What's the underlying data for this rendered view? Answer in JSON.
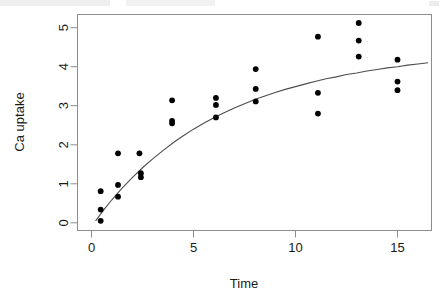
{
  "figure": {
    "title": "",
    "background_color": "#ffffff",
    "point_color": "#000000",
    "curve_color": "#4d4d4d",
    "axis_color": "#8d8d8d"
  },
  "axes": {
    "xlabel": "Time",
    "ylabel": "Ca uptake",
    "x_ticks": [
      "0",
      "5",
      "10",
      "15"
    ],
    "y_ticks": [
      "0",
      "1",
      "2",
      "3",
      "4",
      "5"
    ]
  },
  "chart_data": {
    "type": "scatter",
    "title": "",
    "xlabel": "Time",
    "ylabel": "Ca uptake",
    "xlim": [
      -0.25,
      16.7
    ],
    "ylim": [
      -0.18,
      5.5
    ],
    "x_ticks": [
      0,
      5,
      10,
      15
    ],
    "y_ticks": [
      0,
      1,
      2,
      3,
      4,
      5
    ],
    "grid": false,
    "legend": null,
    "series": [
      {
        "name": "observations",
        "type": "scatter",
        "marker": "filled-circle",
        "color": "#000000",
        "points": [
          [
            0.45,
            0.81
          ],
          [
            0.45,
            0.34
          ],
          [
            0.45,
            0.05
          ],
          [
            1.3,
            1.78
          ],
          [
            1.3,
            0.97
          ],
          [
            1.3,
            0.67
          ],
          [
            2.35,
            1.78
          ],
          [
            2.42,
            1.27
          ],
          [
            2.42,
            1.17
          ],
          [
            3.95,
            3.14
          ],
          [
            3.95,
            2.61
          ],
          [
            3.95,
            2.55
          ],
          [
            6.1,
            3.2
          ],
          [
            6.1,
            3.02
          ],
          [
            6.1,
            2.7
          ],
          [
            8.05,
            3.94
          ],
          [
            8.05,
            3.43
          ],
          [
            8.05,
            3.11
          ],
          [
            11.1,
            4.77
          ],
          [
            11.1,
            3.33
          ],
          [
            11.1,
            2.8
          ],
          [
            13.1,
            5.12
          ],
          [
            13.1,
            4.67
          ],
          [
            13.1,
            4.26
          ],
          [
            15.0,
            4.18
          ],
          [
            15.0,
            3.62
          ],
          [
            15.0,
            3.4
          ]
        ]
      },
      {
        "name": "fitted-curve",
        "type": "line",
        "color": "#4d4d4d",
        "model": "asymptotic-regression",
        "x": [
          0.2,
          0.6,
          1.0,
          1.5,
          2.0,
          2.5,
          3.0,
          3.5,
          4.0,
          4.5,
          5.0,
          5.5,
          6.0,
          6.5,
          7.0,
          7.5,
          8.0,
          8.5,
          9.0,
          9.5,
          10.0,
          10.5,
          11.0,
          11.5,
          12.0,
          12.5,
          13.0,
          13.5,
          14.0,
          14.5,
          15.0,
          15.5,
          16.0,
          16.5
        ],
        "y": [
          0.05,
          0.33,
          0.59,
          0.89,
          1.16,
          1.41,
          1.64,
          1.85,
          2.05,
          2.23,
          2.4,
          2.55,
          2.69,
          2.82,
          2.94,
          3.05,
          3.16,
          3.25,
          3.34,
          3.42,
          3.49,
          3.56,
          3.63,
          3.69,
          3.74,
          3.8,
          3.84,
          3.89,
          3.93,
          3.97,
          4.0,
          4.04,
          4.07,
          4.1
        ]
      }
    ]
  }
}
